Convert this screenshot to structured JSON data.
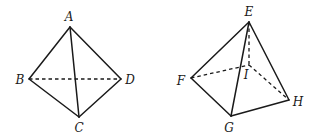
{
  "figures": [
    {
      "name": "tetrahedron-ABCD",
      "vertices": {
        "A": {
          "label": "A",
          "x": 70,
          "y": 27,
          "lx": 69,
          "ly": 21
        },
        "B": {
          "label": "B",
          "x": 29,
          "y": 79,
          "lx": 20,
          "ly": 84
        },
        "C": {
          "label": "C",
          "x": 79,
          "y": 117,
          "lx": 79,
          "ly": 132
        },
        "D": {
          "label": "D",
          "x": 121,
          "y": 79,
          "lx": 130,
          "ly": 84
        }
      },
      "solid_edges": [
        [
          "A",
          "B"
        ],
        [
          "A",
          "C"
        ],
        [
          "A",
          "D"
        ],
        [
          "B",
          "C"
        ],
        [
          "C",
          "D"
        ]
      ],
      "dashed_edges": [
        [
          "B",
          "D"
        ]
      ]
    },
    {
      "name": "pyramid-EFGHI",
      "vertices": {
        "E": {
          "label": "E",
          "x": 249,
          "y": 22,
          "lx": 249,
          "ly": 16
        },
        "F": {
          "label": "F",
          "x": 191,
          "y": 78,
          "lx": 181,
          "ly": 85
        },
        "G": {
          "label": "G",
          "x": 231,
          "y": 116,
          "lx": 229,
          "ly": 132
        },
        "H": {
          "label": "H",
          "x": 289,
          "y": 100,
          "lx": 298,
          "ly": 106
        },
        "I": {
          "label": "I",
          "x": 249,
          "y": 65,
          "lx": 246,
          "ly": 79
        }
      },
      "solid_edges": [
        [
          "E",
          "F"
        ],
        [
          "E",
          "G"
        ],
        [
          "E",
          "H"
        ],
        [
          "F",
          "G"
        ],
        [
          "G",
          "H"
        ]
      ],
      "dashed_edges": [
        [
          "E",
          "I"
        ],
        [
          "F",
          "I"
        ],
        [
          "I",
          "H"
        ]
      ]
    }
  ],
  "colors": {
    "stroke": "#1a1a1a",
    "background": "#ffffff"
  }
}
